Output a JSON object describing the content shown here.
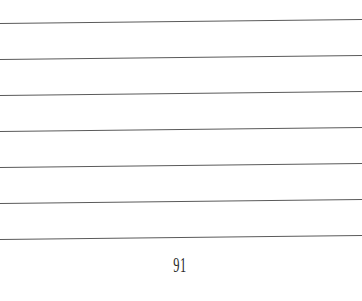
{
  "page": {
    "type": "lined-notebook-page",
    "line_count": 7,
    "line_color": "#5a5a5a",
    "background": "#ffffff",
    "page_number": "91"
  }
}
